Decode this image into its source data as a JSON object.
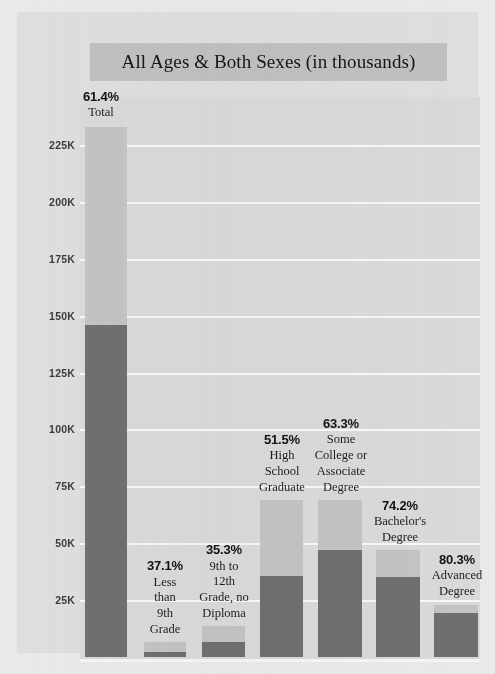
{
  "chart": {
    "title": "All Ages & Both Sexes (in thousands)"
  },
  "colors": {
    "page_background": "#e9e9e7",
    "card_background": "#dededc",
    "plot_background": "#d9d9d7",
    "title_band": "#c0c0be",
    "gridline": "#f7f7f5",
    "bar_light": "#c3c3c1",
    "bar_dark": "#6f6f70",
    "text": "#16161a"
  },
  "chart_data": {
    "type": "bar",
    "title": "All Ages & Both Sexes (in thousands)",
    "xlabel": "",
    "ylabel": "",
    "ylim": [
      0,
      237
    ],
    "yticks": [
      25,
      50,
      75,
      100,
      125,
      150,
      175,
      200,
      225
    ],
    "ytick_labels": [
      "25K",
      "50K",
      "75K",
      "100K",
      "125K",
      "150K",
      "175K",
      "200K",
      "225K"
    ],
    "grid": true,
    "legend": "none",
    "stacked": true,
    "units": "thousands",
    "categories": [
      "Total",
      "Less than 9th Grade",
      "9th to 12th Grade, no Diploma",
      "High School Graduate",
      "Some College or Associate Degree",
      "Bachelor's Degree",
      "Advanced Degree"
    ],
    "series": [
      {
        "name": "Lower (dark) segment",
        "values": [
          146,
          2.4,
          6.6,
          35.5,
          47,
          35,
          19.5
        ]
      },
      {
        "name": "Upper (light) segment",
        "values": [
          87,
          4.3,
          7,
          33.5,
          22,
          12,
          3.5
        ]
      }
    ],
    "totals": [
      233,
      6.7,
      13.6,
      69,
      69,
      47,
      23
    ],
    "annotations": [
      "61.4%",
      "37.1%",
      "35.3%",
      "51.5%",
      "63.3%",
      "74.2%",
      "80.3%"
    ]
  },
  "bars": [
    {
      "id": "total",
      "percent": "61.4%",
      "label_lines": [
        "Total"
      ],
      "left": 5,
      "width": 42,
      "total_k": 233,
      "dark_k": 146,
      "annot_left": -9,
      "annot_width": 60,
      "annot_bottom_k": 236
    },
    {
      "id": "less-than-9th-grade",
      "percent": "37.1%",
      "label_lines": [
        "Less",
        "than",
        "9th",
        "Grade"
      ],
      "left": 64,
      "width": 42,
      "total_k": 6.7,
      "dark_k": 2.4,
      "annot_left": 55,
      "annot_width": 60,
      "annot_bottom_k": 9
    },
    {
      "id": "9th-to-12th-grade-no-diploma",
      "percent": "35.3%",
      "label_lines": [
        "9th to",
        "12th",
        "Grade, no",
        "Diploma"
      ],
      "left": 122,
      "width": 43,
      "total_k": 13.6,
      "dark_k": 6.6,
      "annot_left": 105,
      "annot_width": 78,
      "annot_bottom_k": 16
    },
    {
      "id": "high-school-graduate",
      "percent": "51.5%",
      "label_lines": [
        "High",
        "School",
        "Graduate"
      ],
      "left": 180,
      "width": 43,
      "total_k": 69,
      "dark_k": 35.5,
      "annot_left": 167,
      "annot_width": 70,
      "annot_bottom_k": 71.5
    },
    {
      "id": "some-college-or-associate-degree",
      "percent": "63.3%",
      "label_lines": [
        "Some",
        "College or",
        "Associate",
        "Degree"
      ],
      "left": 238,
      "width": 44,
      "total_k": 69,
      "dark_k": 47,
      "annot_left": 223,
      "annot_width": 76,
      "annot_bottom_k": 71.5
    },
    {
      "id": "bachelors-degree",
      "percent": "74.2%",
      "label_lines": [
        "Bachelor's",
        "Degree"
      ],
      "left": 296,
      "width": 44,
      "total_k": 47,
      "dark_k": 35,
      "annot_left": 284,
      "annot_width": 72,
      "annot_bottom_k": 49.5
    },
    {
      "id": "advanced-degree",
      "percent": "80.3%",
      "label_lines": [
        "Advanced",
        "Degree"
      ],
      "left": 354,
      "width": 44,
      "total_k": 23,
      "dark_k": 19.5,
      "annot_left": 340,
      "annot_width": 74,
      "annot_bottom_k": 25.5
    }
  ]
}
